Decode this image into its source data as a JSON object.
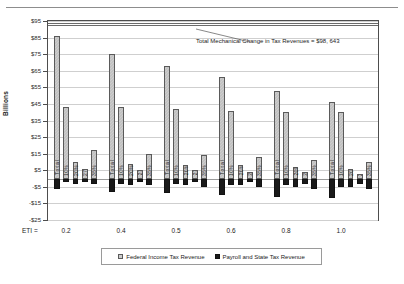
{
  "chart_data": {
    "type": "bar",
    "title": "",
    "xlabel": "ETI =",
    "ylabel": "Billions",
    "ylim": [
      -25,
      95
    ],
    "grid": true,
    "legend_position": "bottom",
    "yticks": [
      "$95",
      "$85",
      "$75",
      "$65",
      "$55",
      "$45",
      "$35",
      "$25",
      "$15",
      "$5",
      "-$5",
      "-$15",
      "-$25"
    ],
    "ytick_values": [
      95,
      85,
      75,
      65,
      55,
      45,
      35,
      25,
      15,
      5,
      -5,
      -15,
      -25
    ],
    "categories": [
      "0.2",
      "0.4",
      "0.5",
      "0.6",
      "0.8",
      "1.0"
    ],
    "category_axis_label": "ETI =",
    "annotation": "Total Mechanical Change in Tax Revenues = $98, 643",
    "annotation_value": 98.643,
    "series": [
      {
        "name": "Federal Income Tax Revenue",
        "color": "#cdcdcd"
      },
      {
        "name": "Payroll and State Tax Revenue",
        "color": "#1a1a1a"
      }
    ],
    "groups": [
      {
        "eti": "0.2",
        "bars": [
          {
            "label": "Total",
            "fed": 86,
            "pay": -6
          },
          {
            "label": "10%",
            "fed": 43,
            "pay": -2
          },
          {
            "label": "20%",
            "fed": 10,
            "pay": -3
          },
          {
            "label": "27%",
            "fed": 6,
            "pay": -2
          },
          {
            "label": "35%",
            "fed": 17,
            "pay": -3
          }
        ]
      },
      {
        "eti": "0.4",
        "bars": [
          {
            "label": "Total",
            "fed": 75,
            "pay": -8
          },
          {
            "label": "10%",
            "fed": 43,
            "pay": -3
          },
          {
            "label": "20%",
            "fed": 9,
            "pay": -4
          },
          {
            "label": "27%",
            "fed": 5,
            "pay": -2
          },
          {
            "label": "35%",
            "fed": 15,
            "pay": -4
          }
        ]
      },
      {
        "eti": "0.5",
        "bars": [
          {
            "label": "Total",
            "fed": 68,
            "pay": -9
          },
          {
            "label": "10%",
            "fed": 42,
            "pay": -3
          },
          {
            "label": "20%",
            "fed": 8,
            "pay": -4
          },
          {
            "label": "27%",
            "fed": 5,
            "pay": -2
          },
          {
            "label": "35%",
            "fed": 14,
            "pay": -5
          }
        ]
      },
      {
        "eti": "0.6",
        "bars": [
          {
            "label": "Total",
            "fed": 61,
            "pay": -10
          },
          {
            "label": "10%",
            "fed": 41,
            "pay": -4
          },
          {
            "label": "20%",
            "fed": 8,
            "pay": -4
          },
          {
            "label": "27%",
            "fed": 4,
            "pay": -2
          },
          {
            "label": "35%",
            "fed": 13,
            "pay": -5
          }
        ]
      },
      {
        "eti": "0.8",
        "bars": [
          {
            "label": "Total",
            "fed": 53,
            "pay": -11
          },
          {
            "label": "10%",
            "fed": 40,
            "pay": -4
          },
          {
            "label": "20%",
            "fed": 7,
            "pay": -5
          },
          {
            "label": "27%",
            "fed": 4,
            "pay": -3
          },
          {
            "label": "35%",
            "fed": 11,
            "pay": -6
          }
        ]
      },
      {
        "eti": "1.0",
        "bars": [
          {
            "label": "Total",
            "fed": 46,
            "pay": -12
          },
          {
            "label": "10%",
            "fed": 40,
            "pay": -5
          },
          {
            "label": "20%",
            "fed": 6,
            "pay": -5
          },
          {
            "label": "27%",
            "fed": 3,
            "pay": -3
          },
          {
            "label": "35%",
            "fed": 10,
            "pay": -6
          }
        ]
      }
    ]
  },
  "legend": {
    "items": [
      {
        "label": "Federal Income Tax Revenue",
        "swatch": "fed"
      },
      {
        "label": "Payroll and State Tax Revenue",
        "swatch": "pay"
      }
    ]
  }
}
